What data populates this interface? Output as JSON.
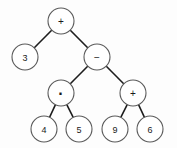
{
  "figure": {
    "background_color": "#fdfdfd",
    "node_fill": "#ffffff",
    "node_stroke": "#5a5a5a",
    "edge_color": "#1d1d1d",
    "expression": "3 + ((4 · 5) − (9 + 6))"
  },
  "tree": {
    "nodes": [
      {
        "id": "n0",
        "label": "+",
        "kind": "operator",
        "cx": 61,
        "cy": 21,
        "r": 13,
        "level": 0
      },
      {
        "id": "n1",
        "label": "3",
        "kind": "operand",
        "cx": 25,
        "cy": 57,
        "r": 13,
        "level": 1
      },
      {
        "id": "n2",
        "label": "−",
        "kind": "operator",
        "cx": 97,
        "cy": 57,
        "r": 13,
        "level": 1
      },
      {
        "id": "n3",
        "label": "·",
        "kind": "operator",
        "cx": 61,
        "cy": 93,
        "r": 13,
        "level": 2
      },
      {
        "id": "n4",
        "label": "+",
        "kind": "operator",
        "cx": 133,
        "cy": 93,
        "r": 13,
        "level": 2
      },
      {
        "id": "n5",
        "label": "4",
        "kind": "operand",
        "cx": 44,
        "cy": 129,
        "r": 13,
        "level": 3
      },
      {
        "id": "n6",
        "label": "5",
        "kind": "operand",
        "cx": 79,
        "cy": 129,
        "r": 13,
        "level": 3
      },
      {
        "id": "n7",
        "label": "9",
        "kind": "operand",
        "cx": 115,
        "cy": 129,
        "r": 13,
        "level": 3
      },
      {
        "id": "n8",
        "label": "6",
        "kind": "operand",
        "cx": 150,
        "cy": 129,
        "r": 13,
        "level": 3
      }
    ],
    "edges": [
      {
        "id": "e0",
        "from": "n0",
        "to": "n1"
      },
      {
        "id": "e1",
        "from": "n0",
        "to": "n2"
      },
      {
        "id": "e2",
        "from": "n2",
        "to": "n3"
      },
      {
        "id": "e3",
        "from": "n2",
        "to": "n4"
      },
      {
        "id": "e4",
        "from": "n3",
        "to": "n5"
      },
      {
        "id": "e5",
        "from": "n3",
        "to": "n6"
      },
      {
        "id": "e6",
        "from": "n4",
        "to": "n7"
      },
      {
        "id": "e7",
        "from": "n4",
        "to": "n8"
      }
    ]
  }
}
